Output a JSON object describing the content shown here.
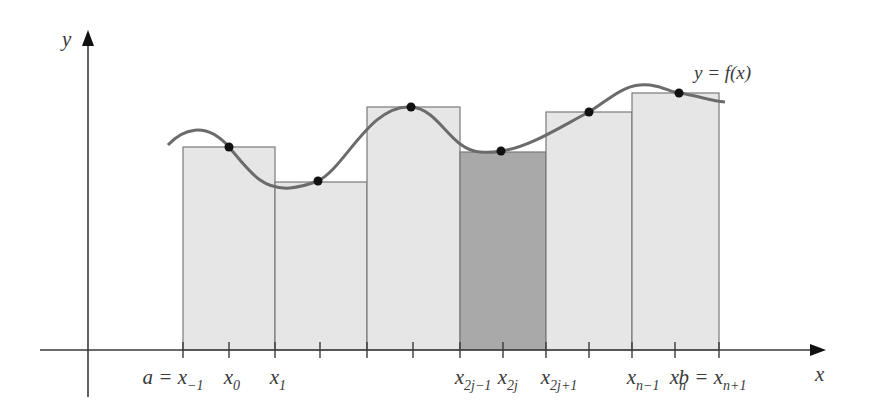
{
  "figure": {
    "type": "riemann-midpoint-diagram",
    "curve_label": "y = f(x)",
    "axis_labels": {
      "x": "x",
      "y": "y"
    },
    "colors": {
      "axis": "#3a3a3a",
      "curve": "#6b6b6b",
      "rect_fill": "#e6e6e6",
      "rect_highlight_fill": "#a9a9a9",
      "rect_stroke": "#7a7a7a",
      "point": "#111111",
      "label": "#3a3a3a"
    },
    "x_axis": {
      "y": 350,
      "x_start": 40,
      "x_end": 826
    },
    "y_axis": {
      "x": 88,
      "y_top": 30,
      "y_bottom": 397
    },
    "ticks_px": [
      183,
      229,
      275,
      320,
      367,
      413,
      460,
      503,
      546,
      589,
      632,
      675,
      719
    ],
    "tick_labels": [
      {
        "base": "a = x",
        "sub": "−1",
        "x": 183
      },
      {
        "base": "x",
        "sub": "0",
        "x": 229
      },
      {
        "base": "x",
        "sub": "1",
        "x": 275
      },
      {
        "base": "x",
        "sub": "2j−1",
        "x": 460
      },
      {
        "base": "x",
        "sub": "2j",
        "x": 503
      },
      {
        "base": "x",
        "sub": "2j+1",
        "x": 546
      },
      {
        "base": "x",
        "sub": "n−1",
        "x": 632
      },
      {
        "base": "x",
        "sub": "n",
        "x": 675
      },
      {
        "base": "b = x",
        "sub": "n+1",
        "x": 719
      }
    ],
    "rectangles": [
      {
        "x0": 183,
        "x1": 275,
        "top": 147,
        "highlight": false
      },
      {
        "x0": 275,
        "x1": 367,
        "top": 182,
        "highlight": false
      },
      {
        "x0": 367,
        "x1": 460,
        "top": 107,
        "highlight": false
      },
      {
        "x0": 460,
        "x1": 546,
        "top": 152,
        "highlight": true
      },
      {
        "x0": 546,
        "x1": 632,
        "top": 112,
        "highlight": false
      },
      {
        "x0": 632,
        "x1": 719,
        "top": 93,
        "highlight": false
      }
    ],
    "midpoints": [
      {
        "x": 229,
        "y": 147
      },
      {
        "x": 318,
        "y": 181
      },
      {
        "x": 411,
        "y": 107
      },
      {
        "x": 501,
        "y": 151
      },
      {
        "x": 589,
        "y": 112
      },
      {
        "x": 679,
        "y": 93
      }
    ],
    "curve_path": "M168,145 C182,130 205,120 229,147 C250,172 262,190 290,188 C302,187 310,184 318,181 C345,168 370,104 411,107 C440,109 450,150 480,152 C490,153 495,152 501,151 C530,147 560,127 589,112 C610,99 625,82 650,85 C665,87 670,92 679,93 C700,96 710,101 725,102"
  }
}
